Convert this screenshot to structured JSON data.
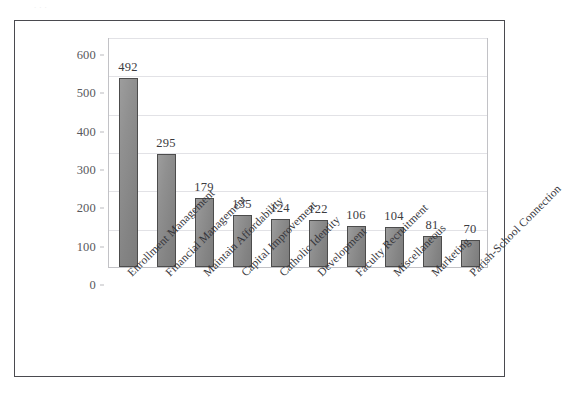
{
  "figure": {
    "top_remnant_text": ". . ."
  },
  "chart_data": {
    "type": "bar",
    "title": "",
    "subtitle": "",
    "xlabel": "",
    "ylabel": "",
    "ylim": [
      0,
      600
    ],
    "ytick_values": [
      0,
      100,
      200,
      300,
      400,
      500,
      600
    ],
    "ytick_labels": [
      "0",
      "100",
      "200",
      "300",
      "400",
      "500",
      "600"
    ],
    "grid": true,
    "grid_axis": "y",
    "legend": false,
    "legend_position": "none",
    "orientation": "vertical",
    "bar_color": "#8a8a8a",
    "bar_edge_color": "#4c4c4c",
    "plot_border_color": "#c2c2c6",
    "frame_border_color": "#4a4a4f",
    "categories": [
      "Enrollment Management",
      "Financial Management",
      "Maintain Affordability",
      "Capital Improvement",
      "Catholic Identity",
      "Development",
      "Faculty Recruitment",
      "Miscellaneous",
      "Marketing",
      "Parish-School Connection"
    ],
    "values": [
      492,
      295,
      179,
      135,
      124,
      122,
      106,
      104,
      81,
      70
    ],
    "data_labels": [
      "492",
      "295",
      "179",
      "135",
      "124",
      "122",
      "106",
      "104",
      "81",
      "70"
    ],
    "category_label_rotation": -45
  }
}
